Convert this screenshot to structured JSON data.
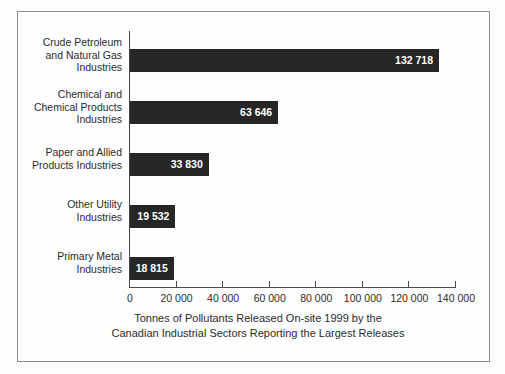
{
  "chart_data": {
    "type": "bar",
    "orientation": "horizontal",
    "title": "",
    "xlabel_lines": [
      "Tonnes of Pollutants Released On-site 1999 by the",
      "Canadian Industrial Sectors Reporting the Largest Releases"
    ],
    "ylabel": "",
    "categories": [
      "Crude Petroleum and Natural Gas Industries",
      "Chemical and Chemical Products Industries",
      "Paper and Allied Products Industries",
      "Other Utility Industries",
      "Primary Metal Industries"
    ],
    "category_label_lines": [
      [
        "Crude Petroleum",
        "and Natural Gas",
        "Industries"
      ],
      [
        "Chemical and",
        "Chemical Products",
        "Industries"
      ],
      [
        "Paper and Allied",
        "Products Industries"
      ],
      [
        "Other Utility",
        "Industries"
      ],
      [
        "Primary Metal",
        "Industries"
      ]
    ],
    "values": [
      132718,
      63646,
      33830,
      19532,
      18815
    ],
    "value_labels": [
      "132 718",
      "63 646",
      "33 830",
      "19 532",
      "18 815"
    ],
    "xlim": [
      0,
      140000
    ],
    "xticks": [
      0,
      20000,
      40000,
      60000,
      80000,
      100000,
      120000,
      140000
    ],
    "xtick_labels": [
      "0",
      "20 000",
      "40 000",
      "60 000",
      "80 000",
      "100 000",
      "120 000",
      "140 000"
    ],
    "grid": false,
    "legend": null,
    "bar_color": "#262626",
    "value_label_color": "#ffffff",
    "axis_color": "#4a4a4a",
    "text_color": "#2b2b2b",
    "background_color": "#fefefe",
    "frame_color": "#8c8c8c"
  }
}
